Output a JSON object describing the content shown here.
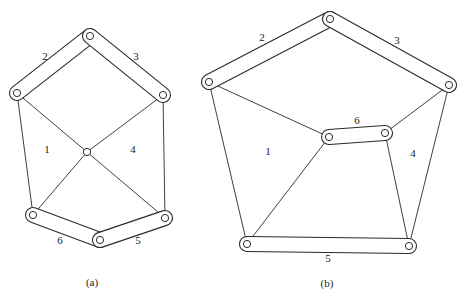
{
  "figures": [
    {
      "id": "a",
      "caption": "(a)",
      "caption_pos": [
        92,
        283
      ],
      "joints": {
        "A": [
          90,
          36
        ],
        "B": [
          17,
          93
        ],
        "C": [
          163,
          95
        ],
        "D": [
          87,
          152
        ],
        "E": [
          33,
          215
        ],
        "F": [
          100,
          240
        ],
        "G": [
          165,
          218
        ]
      },
      "links": [
        {
          "label": "2",
          "type": "binary-link",
          "from": "A",
          "to": "B",
          "label_pos": [
            45,
            57
          ]
        },
        {
          "label": "3",
          "type": "binary-link",
          "from": "A",
          "to": "C",
          "label_pos": [
            136,
            57
          ]
        },
        {
          "label": "6",
          "type": "binary-link",
          "from": "E",
          "to": "F",
          "label_pos": [
            60,
            241
          ]
        },
        {
          "label": "5",
          "type": "binary-link",
          "from": "F",
          "to": "G",
          "label_pos": [
            138,
            241
          ]
        }
      ],
      "bars": [
        [
          "B",
          "E"
        ],
        [
          "C",
          "G"
        ],
        [
          "B",
          "D"
        ],
        [
          "C",
          "D"
        ],
        [
          "D",
          "E"
        ],
        [
          "D",
          "G"
        ]
      ],
      "region_labels": [
        {
          "text": "1",
          "pos": [
            47,
            150
          ]
        },
        {
          "text": "4",
          "pos": [
            133,
            150
          ]
        }
      ]
    },
    {
      "id": "b",
      "caption": "(b)",
      "caption_pos": [
        327,
        284
      ],
      "joints": {
        "A": [
          330,
          19
        ],
        "B": [
          209,
          82
        ],
        "C": [
          449,
          85
        ],
        "D": [
          329,
          137
        ],
        "E": [
          385,
          133
        ],
        "F": [
          247,
          244
        ],
        "G": [
          409,
          246
        ]
      },
      "links": [
        {
          "label": "2",
          "type": "binary-link",
          "from": "A",
          "to": "B",
          "label_pos": [
            262,
            38
          ]
        },
        {
          "label": "3",
          "type": "binary-link",
          "from": "A",
          "to": "C",
          "label_pos": [
            397,
            41
          ]
        },
        {
          "label": "6",
          "type": "binary-link",
          "from": "D",
          "to": "E",
          "label_pos": [
            357,
            121
          ]
        },
        {
          "label": "5",
          "type": "binary-link",
          "from": "F",
          "to": "G",
          "label_pos": [
            328,
            259
          ]
        }
      ],
      "bars": [
        [
          "B",
          "F"
        ],
        [
          "C",
          "G"
        ],
        [
          "B",
          "D"
        ],
        [
          "C",
          "E"
        ],
        [
          "D",
          "F"
        ],
        [
          "E",
          "G"
        ]
      ],
      "region_labels": [
        {
          "text": "1",
          "pos": [
            268,
            152
          ]
        },
        {
          "text": "4",
          "pos": [
            413,
            154
          ]
        }
      ]
    }
  ]
}
